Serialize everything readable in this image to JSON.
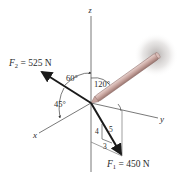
{
  "diagram": {
    "axes": {
      "x_label": "x",
      "y_label": "y",
      "z_label": "z"
    },
    "forces": [
      {
        "name": "F",
        "subscript": "2",
        "equals": " = 525 N",
        "magnitude": 525,
        "unit": "N"
      },
      {
        "name": "F",
        "subscript": "1",
        "equals": " = 450 N",
        "magnitude": 450,
        "unit": "N"
      }
    ],
    "angles": {
      "f2_from_z": "60°",
      "f2_from_x": "45°",
      "pipe_from_z": "120°"
    },
    "slope_triangle": {
      "vertical": "4",
      "hypotenuse": "5",
      "horizontal": "3"
    },
    "colors": {
      "axis": "#6a6a6a",
      "force_arrow": "#1a1a1a",
      "pipe": "#c9a6a0",
      "pipe_edge": "#8a6a66",
      "glow": "#b0aaa8",
      "text": "#2a2a2a"
    }
  }
}
